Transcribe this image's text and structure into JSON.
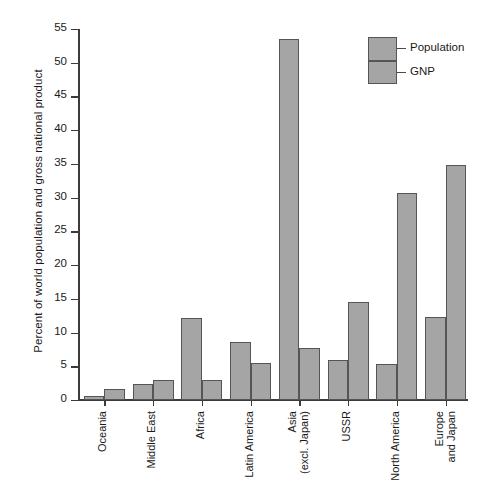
{
  "chart_data": {
    "type": "bar",
    "title": "",
    "xlabel": "",
    "ylabel": "Percent of world population and gross national product",
    "ylim": [
      0,
      55
    ],
    "yticks": [
      0,
      5,
      10,
      15,
      20,
      25,
      30,
      35,
      40,
      45,
      50,
      55
    ],
    "grid": false,
    "legend_position": "top-right",
    "categories": [
      "Oceania",
      "Middle East",
      "Africa",
      "Latin America",
      "Asia (excl. Japan)",
      "USSR",
      "North America",
      "Europe and Japan"
    ],
    "category_lines": [
      [
        "Oceania"
      ],
      [
        "Middle East"
      ],
      [
        "Africa"
      ],
      [
        "Latin America"
      ],
      [
        "Asia",
        "(excl. Japan)"
      ],
      [
        "USSR"
      ],
      [
        "North America"
      ],
      [
        "Europe",
        "and Japan"
      ]
    ],
    "series": [
      {
        "name": "Population",
        "color": "#a5a5a5",
        "values": [
          0.6,
          2.4,
          12.2,
          8.6,
          53.5,
          5.9,
          5.4,
          12.3
        ]
      },
      {
        "name": "GNP",
        "color": "#a5a5a5",
        "values": [
          1.6,
          3.0,
          3.0,
          5.5,
          7.7,
          14.5,
          30.7,
          34.9
        ]
      }
    ]
  },
  "legend": {
    "entries": [
      {
        "label": "Population"
      },
      {
        "label": "GNP"
      }
    ]
  },
  "colors": {
    "bar_fill": "#a5a5a5",
    "bar_stroke": "#555555",
    "axis": "#3b3b3b",
    "text": "#1a1a1a",
    "background": "#ffffff"
  }
}
